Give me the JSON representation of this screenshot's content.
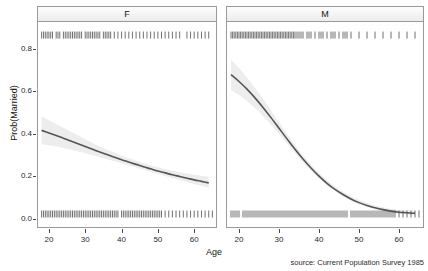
{
  "chart_data": {
    "type": "line",
    "title": "",
    "xlabel": "Age",
    "ylabel": "Prob(Married)",
    "caption": "source: Current Population Survey 1985",
    "xlim": [
      17,
      66
    ],
    "ylim": [
      -0.04,
      0.92
    ],
    "xticks": [
      20,
      30,
      40,
      50,
      60
    ],
    "yticks": [
      0.0,
      0.2,
      0.4,
      0.6,
      0.8
    ],
    "ytick_labels": [
      "0.0",
      "0.2",
      "0.4",
      "0.6",
      "0.8"
    ],
    "xtick_labels": [
      "20",
      "30",
      "40",
      "50",
      "60"
    ],
    "grid": false,
    "legend": "none",
    "facet_variable": "sex",
    "panels": [
      {
        "label": "F",
        "series": [
          {
            "name": "Prob(Married)",
            "kind": "fitted-logistic-curve",
            "color": "#555555",
            "x": [
              18,
              20,
              22,
              24,
              26,
              28,
              30,
              32,
              34,
              36,
              38,
              40,
              42,
              44,
              46,
              48,
              50,
              52,
              54,
              56,
              58,
              60,
              62,
              64
            ],
            "y": [
              0.41,
              0.398,
              0.386,
              0.373,
              0.36,
              0.347,
              0.334,
              0.321,
              0.308,
              0.296,
              0.284,
              0.272,
              0.261,
              0.25,
              0.239,
              0.229,
              0.219,
              0.21,
              0.201,
              0.193,
              0.185,
              0.177,
              0.17,
              0.163
            ]
          },
          {
            "name": "95% confidence band",
            "kind": "ribbon",
            "color": "#ededed",
            "x": [
              18,
              20,
              22,
              24,
              26,
              28,
              30,
              32,
              34,
              36,
              38,
              40,
              42,
              44,
              46,
              48,
              50,
              52,
              54,
              56,
              58,
              60,
              62,
              64
            ],
            "ymin": [
              0.345,
              0.34,
              0.334,
              0.327,
              0.319,
              0.311,
              0.302,
              0.293,
              0.284,
              0.274,
              0.265,
              0.255,
              0.245,
              0.235,
              0.225,
              0.215,
              0.205,
              0.195,
              0.186,
              0.176,
              0.167,
              0.158,
              0.149,
              0.14
            ],
            "ymax": [
              0.478,
              0.458,
              0.44,
              0.422,
              0.404,
              0.386,
              0.368,
              0.351,
              0.334,
              0.319,
              0.305,
              0.291,
              0.279,
              0.267,
              0.256,
              0.246,
              0.236,
              0.228,
              0.22,
              0.213,
              0.207,
              0.201,
              0.196,
              0.192
            ]
          }
        ],
        "rug_top": {
          "name": "married-observations",
          "y_value": 0.875,
          "x": [
            18,
            18.5,
            19,
            19.5,
            20,
            20.5,
            21,
            22,
            22.5,
            23,
            24,
            24.5,
            25,
            25.5,
            26,
            26.5,
            27,
            27.5,
            28,
            28.5,
            29,
            30,
            30.5,
            31,
            31.5,
            32,
            32.5,
            33,
            33.5,
            34,
            35,
            35.5,
            36,
            36.5,
            37,
            38,
            39,
            40,
            41,
            42,
            43,
            44,
            45,
            46,
            47,
            48,
            49,
            50,
            51,
            52,
            53,
            54,
            55,
            56,
            58,
            59,
            60,
            61,
            62,
            63,
            64
          ]
        },
        "rug_bottom": {
          "name": "unmarried-observations",
          "y_value": 0.0,
          "x": [
            18,
            18.5,
            19,
            19.5,
            20,
            20.5,
            21,
            21.5,
            22,
            22.5,
            23,
            23.5,
            24,
            24.5,
            25,
            25.5,
            26,
            26.5,
            27,
            27.5,
            28,
            28.5,
            29,
            29.5,
            30,
            30.5,
            31,
            31.5,
            32,
            32.5,
            33,
            33.5,
            34,
            34.5,
            35,
            35.5,
            36,
            36.5,
            37,
            37.5,
            38,
            38.5,
            39,
            40,
            40.5,
            41,
            41.5,
            42,
            42.5,
            43,
            43.5,
            44,
            44.5,
            45,
            45.5,
            46,
            46.5,
            47,
            47.5,
            48,
            48.5,
            49,
            49.5,
            50,
            50.5,
            51,
            52,
            53,
            54,
            55,
            56,
            57,
            58,
            59,
            60,
            61,
            62,
            63,
            64,
            65
          ]
        }
      },
      {
        "label": "M",
        "series": [
          {
            "name": "Prob(Married)",
            "kind": "fitted-logistic-curve",
            "color": "#555555",
            "x": [
              18,
              20,
              22,
              24,
              26,
              28,
              30,
              32,
              34,
              36,
              38,
              40,
              42,
              44,
              46,
              48,
              50,
              52,
              54,
              56,
              58,
              60,
              62,
              64
            ],
            "y": [
              0.672,
              0.64,
              0.604,
              0.563,
              0.518,
              0.47,
              0.42,
              0.37,
              0.321,
              0.275,
              0.233,
              0.195,
              0.161,
              0.132,
              0.108,
              0.087,
              0.07,
              0.057,
              0.046,
              0.037,
              0.03,
              0.025,
              0.022,
              0.02
            ]
          },
          {
            "name": "95% confidence band",
            "kind": "ribbon",
            "color": "#ededed",
            "x": [
              18,
              20,
              22,
              24,
              26,
              28,
              30,
              32,
              34,
              36,
              38,
              40,
              42,
              44,
              46,
              48,
              50,
              52,
              54,
              56,
              58,
              60,
              62,
              64
            ],
            "ymin": [
              0.6,
              0.576,
              0.548,
              0.515,
              0.478,
              0.437,
              0.393,
              0.348,
              0.303,
              0.26,
              0.22,
              0.184,
              0.151,
              0.123,
              0.099,
              0.079,
              0.062,
              0.049,
              0.038,
              0.029,
              0.023,
              0.018,
              0.014,
              0.012
            ],
            "ymax": [
              0.742,
              0.703,
              0.659,
              0.611,
              0.559,
              0.504,
              0.448,
              0.393,
              0.341,
              0.293,
              0.249,
              0.21,
              0.176,
              0.146,
              0.121,
              0.1,
              0.082,
              0.068,
              0.057,
              0.048,
              0.041,
              0.036,
              0.033,
              0.032
            ]
          }
        ],
        "rug_top": {
          "name": "married-observations",
          "y_value": 0.875,
          "x": [
            18,
            18.4,
            18.8,
            19.2,
            19.6,
            20,
            20.4,
            20.8,
            21.2,
            21.6,
            22,
            22.4,
            22.8,
            23.2,
            23.6,
            24,
            24.4,
            24.8,
            25.2,
            25.6,
            26,
            26.4,
            26.8,
            27.2,
            27.6,
            28,
            28.4,
            28.8,
            29.2,
            29.6,
            30,
            30.4,
            30.8,
            31.2,
            31.6,
            32,
            32.4,
            32.8,
            33.2,
            33.6,
            34,
            34.5,
            35,
            35.5,
            36,
            37,
            37.5,
            38,
            39,
            40,
            40.5,
            41,
            42,
            43,
            43.5,
            44,
            45,
            46,
            46.5,
            47,
            48,
            50,
            52,
            54,
            56,
            58,
            60,
            62,
            64
          ]
        },
        "rug_bottom": {
          "name": "unmarried-observations",
          "y_value": 0.0,
          "x": [
            18,
            18.5,
            19,
            19.5,
            20,
            21,
            21.5,
            22,
            22.5,
            23,
            23.5,
            24,
            24.5,
            25,
            25.5,
            26,
            26.5,
            27,
            27.5,
            28,
            28.5,
            29,
            29.5,
            30,
            30.5,
            31,
            31.5,
            32,
            32.5,
            33,
            33.5,
            34,
            34.5,
            35,
            35.5,
            36,
            36.5,
            37,
            37.5,
            38,
            38.5,
            39,
            39.5,
            40,
            40.5,
            41,
            41.5,
            42,
            42.5,
            43,
            43.5,
            44,
            44.5,
            45,
            45.5,
            46,
            46.5,
            47,
            48,
            48.5,
            49,
            49.5,
            50,
            50.5,
            51,
            51.5,
            52,
            52.5,
            53,
            53.5,
            54,
            54.5,
            55,
            55.5,
            56,
            56.5,
            57,
            57.5,
            58,
            58.5,
            59,
            60,
            61,
            62,
            63,
            64,
            65
          ]
        }
      }
    ]
  }
}
